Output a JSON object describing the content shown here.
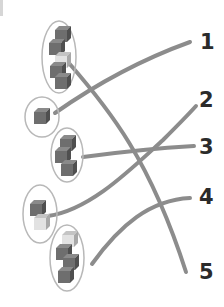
{
  "exercise": {
    "type": "matching",
    "description": "Match each cube stack to the number of cubes it contains"
  },
  "colors": {
    "line": "#8c8c8c",
    "ellipse": "#b8b8b8",
    "cube_dark": "#6e6e6e",
    "cube_light": "#dcdcdc",
    "label": "#2b2b2b"
  },
  "stacks": [
    {
      "id": "A",
      "cube_count": 5,
      "center": [
        59,
        57
      ],
      "rx": 17,
      "ry": 36,
      "matches": "5"
    },
    {
      "id": "B",
      "cube_count": 1,
      "center": [
        42,
        117
      ],
      "rx": 17,
      "ry": 20,
      "matches": "1"
    },
    {
      "id": "C",
      "cube_count": 3,
      "center": [
        67,
        155
      ],
      "rx": 16,
      "ry": 27,
      "matches": "3"
    },
    {
      "id": "D",
      "cube_count": 2,
      "center": [
        40,
        214
      ],
      "rx": 17,
      "ry": 29,
      "matches": "2"
    },
    {
      "id": "E",
      "cube_count": 4,
      "center": [
        67,
        258
      ],
      "rx": 17,
      "ry": 33,
      "matches": "4"
    }
  ],
  "labels": {
    "n1": "1",
    "n2": "2",
    "n3": "3",
    "n4": "4",
    "n5": "5"
  },
  "connections": [
    {
      "from": "A",
      "to": "5"
    },
    {
      "from": "B",
      "to": "1"
    },
    {
      "from": "C",
      "to": "3"
    },
    {
      "from": "D",
      "to": "2"
    },
    {
      "from": "E",
      "to": "4"
    }
  ]
}
